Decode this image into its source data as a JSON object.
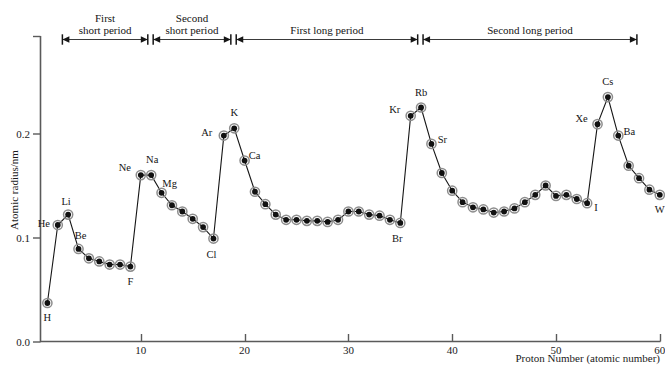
{
  "figure": {
    "y_axis_title": "Atomic radius/nm",
    "x_axis_title": "Proton Number (atomic number)",
    "y_ticks": [
      "0.0",
      "0.1",
      "0.2"
    ],
    "x_ticks": [
      "10",
      "20",
      "30",
      "40",
      "50",
      "60"
    ],
    "line_color": "#161616",
    "marker_fill": "#111111",
    "marker_ring": "#8d8d8d",
    "axis_color": "#5a5a5a"
  },
  "period_bands": [
    {
      "label_line1": "First",
      "label_line2": "short  period",
      "x_start": 1,
      "x_end": 10
    },
    {
      "label_line1": "Second",
      "label_line2": "short  period",
      "x_start": 11,
      "x_end": 18
    },
    {
      "label_line1": "",
      "label_line2": "First  long  period",
      "x_start": 19,
      "x_end": 36
    },
    {
      "label_line1": "",
      "label_line2": "Second  long  period",
      "x_start": 37,
      "x_end": 55
    }
  ],
  "chart_data": {
    "type": "line",
    "title": "",
    "xlabel": "Proton Number (atomic number)",
    "ylabel": "Atomic radius/nm",
    "xlim": [
      0,
      61
    ],
    "ylim": [
      0.0,
      0.235
    ],
    "xticks": [
      10,
      20,
      30,
      40,
      50,
      60
    ],
    "yticks": [
      0.0,
      0.1,
      0.2
    ],
    "grid": false,
    "legend": "none",
    "series": [
      {
        "name": "Atomic radius",
        "x": [
          1,
          2,
          3,
          4,
          5,
          6,
          7,
          8,
          9,
          10,
          11,
          12,
          13,
          14,
          15,
          16,
          17,
          18,
          19,
          20,
          21,
          22,
          23,
          24,
          25,
          26,
          27,
          28,
          29,
          30,
          31,
          32,
          33,
          34,
          35,
          36,
          37,
          38,
          39,
          40,
          41,
          42,
          43,
          44,
          45,
          46,
          47,
          48,
          49,
          50,
          51,
          52,
          53,
          54,
          55,
          56,
          57,
          58,
          59,
          60
        ],
        "y": [
          0.037,
          0.112,
          0.122,
          0.089,
          0.08,
          0.077,
          0.074,
          0.074,
          0.072,
          0.16,
          0.16,
          0.143,
          0.131,
          0.125,
          0.118,
          0.11,
          0.099,
          0.198,
          0.205,
          0.174,
          0.144,
          0.132,
          0.122,
          0.117,
          0.117,
          0.116,
          0.116,
          0.115,
          0.117,
          0.125,
          0.125,
          0.122,
          0.121,
          0.117,
          0.114,
          0.217,
          0.225,
          0.19,
          0.162,
          0.145,
          0.134,
          0.129,
          0.127,
          0.124,
          0.125,
          0.128,
          0.134,
          0.141,
          0.15,
          0.14,
          0.141,
          0.137,
          0.133,
          0.209,
          0.235,
          0.198,
          0.169,
          0.157,
          0.146,
          0.141
        ]
      }
    ],
    "point_labels": [
      {
        "symbol": "H",
        "z": 1,
        "dx": 0,
        "dy": 18
      },
      {
        "symbol": "He",
        "z": 2,
        "dx": -14,
        "dy": 2
      },
      {
        "symbol": "Li",
        "z": 3,
        "dx": -2,
        "dy": -10
      },
      {
        "symbol": "Be",
        "z": 4,
        "dx": 2,
        "dy": -10
      },
      {
        "symbol": "F",
        "z": 9,
        "dx": 0,
        "dy": 18
      },
      {
        "symbol": "Ne",
        "z": 10,
        "dx": -16,
        "dy": -4
      },
      {
        "symbol": "Na",
        "z": 11,
        "dx": 1,
        "dy": -12
      },
      {
        "symbol": "Mg",
        "z": 12,
        "dx": 8,
        "dy": -6
      },
      {
        "symbol": "Cl",
        "z": 17,
        "dx": -2,
        "dy": 19
      },
      {
        "symbol": "Ar",
        "z": 18,
        "dx": -17,
        "dy": 0
      },
      {
        "symbol": "K",
        "z": 19,
        "dx": 0,
        "dy": -12
      },
      {
        "symbol": "Ca",
        "z": 20,
        "dx": 10,
        "dy": -2
      },
      {
        "symbol": "Br",
        "z": 35,
        "dx": -3,
        "dy": 19
      },
      {
        "symbol": "Kr",
        "z": 36,
        "dx": -16,
        "dy": -3
      },
      {
        "symbol": "Rb",
        "z": 37,
        "dx": 0,
        "dy": -12
      },
      {
        "symbol": "Sr",
        "z": 38,
        "dx": 11,
        "dy": -1
      },
      {
        "symbol": "I",
        "z": 53,
        "dx": 9,
        "dy": 8
      },
      {
        "symbol": "Xe",
        "z": 54,
        "dx": -16,
        "dy": -2
      },
      {
        "symbol": "Cs",
        "z": 55,
        "dx": 0,
        "dy": -12
      },
      {
        "symbol": "Ba",
        "z": 56,
        "dx": 11,
        "dy": -1
      },
      {
        "symbol": "W",
        "z": 60,
        "dx": 0,
        "dy": 18
      }
    ]
  }
}
